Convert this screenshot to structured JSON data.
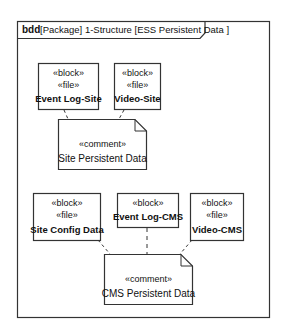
{
  "frame": {
    "kind": "bdd",
    "title": "[Package] 1-Structure  [ESS Persistent Data ]"
  },
  "site_group": {
    "blocks": [
      {
        "stereotypes": [
          "«block»",
          "«file»"
        ],
        "name": "Event Log-Site"
      },
      {
        "stereotypes": [
          "«block»",
          "«file»"
        ],
        "name": "Video-Site"
      }
    ],
    "comment": {
      "stereotype": "«comment»",
      "text": "Site Persistent Data"
    }
  },
  "cms_group": {
    "blocks": [
      {
        "stereotypes": [
          "«block»",
          "«file»"
        ],
        "name": "Site Config Data"
      },
      {
        "stereotypes": [
          "«block»"
        ],
        "name": "Event Log-CMS"
      },
      {
        "stereotypes": [
          "«block»",
          "«file»"
        ],
        "name": "Video-CMS"
      }
    ],
    "comment": {
      "stereotype": "«comment»",
      "text": "CMS Persistent Data"
    }
  },
  "colors": {
    "line": "#333333",
    "background": "#ffffff",
    "text": "#111111"
  }
}
